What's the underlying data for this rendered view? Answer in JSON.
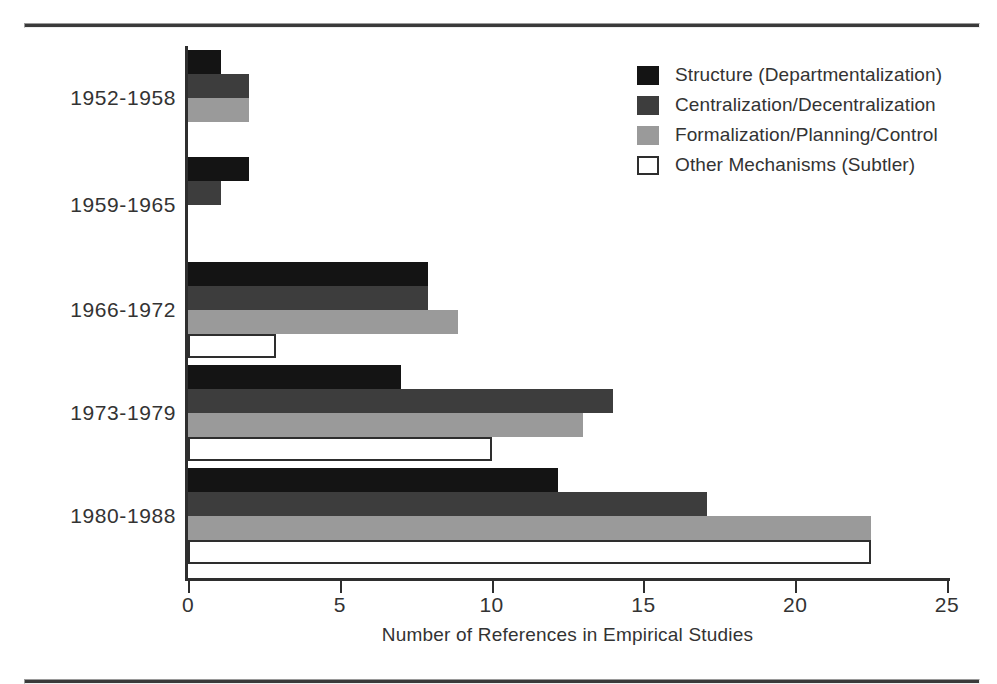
{
  "chart_data": {
    "type": "bar",
    "orientation": "horizontal",
    "title": "",
    "xlabel": "Number of References in Empirical Studies",
    "ylabel": "",
    "xlim": [
      0,
      25
    ],
    "xticks": [
      0,
      5,
      10,
      15,
      20,
      25
    ],
    "xtick_labels": [
      "0",
      "5",
      "10",
      "15",
      "20",
      "25"
    ],
    "grid": false,
    "legend_position": "upper right",
    "categories": [
      "1952-1958",
      "1959-1965",
      "1966-1972",
      "1973-1979",
      "1980-1988"
    ],
    "series": [
      {
        "name": "Structure (Departmentalization)",
        "color": "#141414",
        "values": [
          1.1,
          2.0,
          7.9,
          7.0,
          12.2
        ]
      },
      {
        "name": "Centralization/Decentralization",
        "color": "#3d3d3d",
        "values": [
          2.0,
          1.1,
          7.9,
          14.0,
          17.1
        ]
      },
      {
        "name": "Formalization/Planning/Control",
        "color": "#9a9a9a",
        "values": [
          2.0,
          0,
          8.9,
          13.0,
          22.5
        ]
      },
      {
        "name": "Other Mechanisms (Subtler)",
        "color": "#ffffff",
        "values": [
          0,
          0,
          2.9,
          10.0,
          22.5
        ]
      }
    ]
  },
  "legend": {
    "items": [
      {
        "label": "Structure (Departmentalization)",
        "swatch": "s0"
      },
      {
        "label": "Centralization/Decentralization",
        "swatch": "s1"
      },
      {
        "label": "Formalization/Planning/Control",
        "swatch": "s2"
      },
      {
        "label": "Other Mechanisms (Subtler)",
        "swatch": "s3"
      }
    ]
  }
}
